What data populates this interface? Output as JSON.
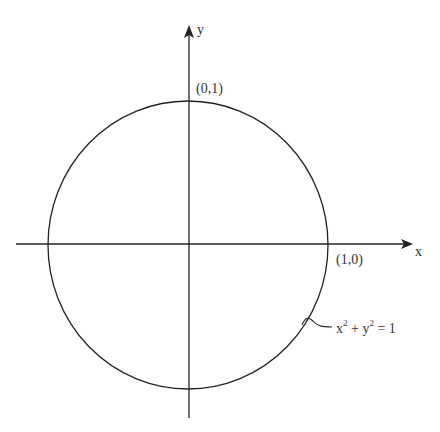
{
  "diagram": {
    "axes": {
      "x_label": "x",
      "y_label": "y"
    },
    "points": [
      {
        "label": "(0,1)"
      },
      {
        "label": "(1,0)"
      }
    ],
    "equation": {
      "x_term": "x",
      "x_exp": "2",
      "plus": " + ",
      "y_term": "y",
      "y_exp": "2",
      "rhs": " = 1"
    },
    "colors": {
      "stroke": "#222222",
      "background": "#ffffff"
    }
  }
}
